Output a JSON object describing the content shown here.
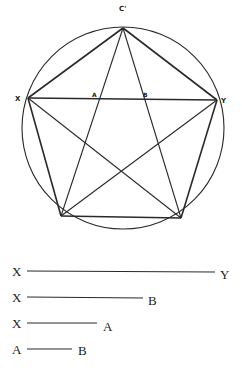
{
  "diagram": {
    "type": "geometric construction",
    "circle": {
      "cx": 123,
      "cy": 128,
      "r": 101
    },
    "vertices": {
      "top": {
        "label": "C'",
        "x": 123,
        "y": 28
      },
      "left": {
        "label": "X",
        "x": 28,
        "y": 98
      },
      "right": {
        "label": "Y",
        "x": 217,
        "y": 100
      },
      "bottom_left": {
        "label": "",
        "x": 61,
        "y": 216
      },
      "bottom_right": {
        "label": "",
        "x": 181,
        "y": 218
      }
    },
    "intersections": {
      "A": {
        "label": "A",
        "x": 96,
        "y": 99
      },
      "B": {
        "label": "B",
        "x": 148,
        "y": 99
      }
    },
    "labels": {
      "top": "C'",
      "left": "X",
      "right": "Y",
      "a": "A",
      "b": "B"
    }
  },
  "segments": [
    {
      "start_label": "X",
      "end_label": "Y",
      "y": 271,
      "x1": 27,
      "x2": 215
    },
    {
      "start_label": "X",
      "end_label": "B",
      "y": 298,
      "x1": 27,
      "x2": 143
    },
    {
      "start_label": "X",
      "end_label": "A",
      "y": 323,
      "x1": 27,
      "x2": 97
    },
    {
      "start_label": "A",
      "end_label": "B",
      "y": 349,
      "x1": 27,
      "x2": 72
    }
  ],
  "colors": {
    "ink": "#2a2a2a",
    "background": "#ffffff"
  }
}
